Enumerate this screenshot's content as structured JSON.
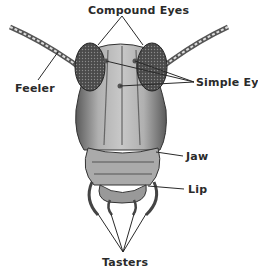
{
  "labels": {
    "compound_eyes": "Compound Eyes",
    "simple_eye": "Simple Eye",
    "feeler": "Feeler",
    "jaw": "Jaw",
    "lip": "Lip",
    "tasters": "Tasters"
  },
  "colors": {
    "ink": "#2a2a2a",
    "head_fill": "#9a9a9a",
    "eye_fill": "#3a3a3a",
    "background": "#ffffff"
  }
}
